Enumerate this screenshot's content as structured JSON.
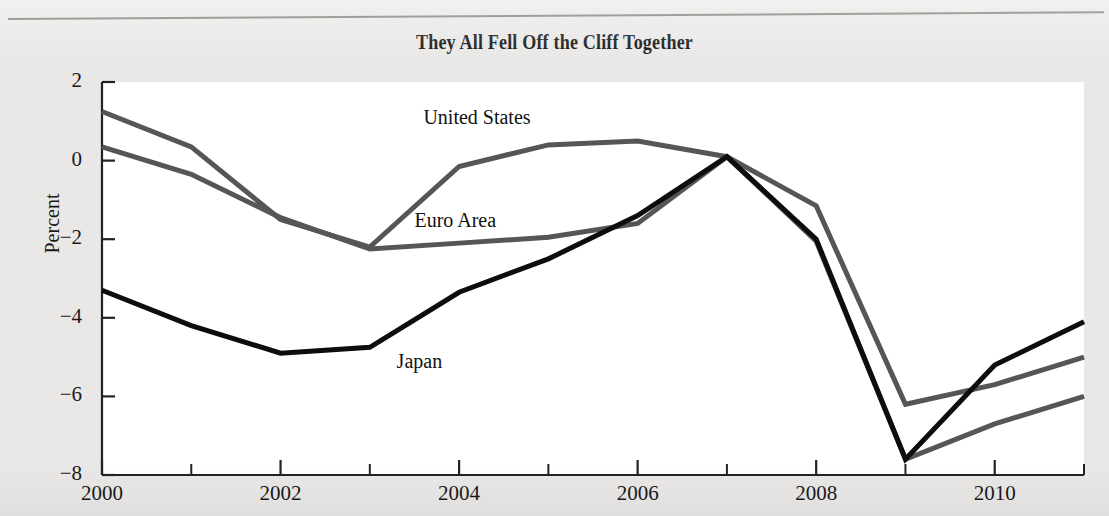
{
  "page": {
    "background_color": "#e9e8e6",
    "plot_background_color": "#ffffff"
  },
  "chart_data": {
    "type": "line",
    "title": "They All Fell Off the Cliff Together",
    "xlabel": "",
    "ylabel": "Percent",
    "x": [
      2000,
      2001,
      2002,
      2003,
      2004,
      2005,
      2006,
      2007,
      2008,
      2009,
      2010,
      2011
    ],
    "xlim": [
      2000,
      2011
    ],
    "ylim": [
      -8,
      2
    ],
    "yticks": [
      2,
      0,
      -2,
      -4,
      -6,
      -8
    ],
    "ytick_labels": [
      "2",
      "0",
      "−2",
      "−4",
      "−6",
      "−8"
    ],
    "xticks": [
      2000,
      2002,
      2004,
      2006,
      2008,
      2010
    ],
    "xtick_labels": [
      "2000",
      "2002",
      "2004",
      "2006",
      "2008",
      "2010"
    ],
    "xminor_ticks": [
      2001,
      2003,
      2005,
      2007,
      2009,
      2011
    ],
    "grid": false,
    "legend": "inline-annotations",
    "series": [
      {
        "name": "United States",
        "color": "#565656",
        "width": 5,
        "values": [
          1.25,
          0.35,
          -1.5,
          -2.2,
          -0.15,
          0.4,
          0.5,
          0.1,
          -1.15,
          -6.2,
          -5.7,
          -5.0
        ],
        "label_x": 2003.6,
        "label_y": 1.05
      },
      {
        "name": "Euro Area",
        "color": "#565656",
        "width": 5,
        "values": [
          0.35,
          -0.35,
          -1.45,
          -2.25,
          -2.1,
          -1.95,
          -1.6,
          0.1,
          -2.05,
          -7.6,
          -6.7,
          -6.0
        ],
        "label_x": 2003.5,
        "label_y": -1.55
      },
      {
        "name": "Japan",
        "color": "#0d0d0d",
        "width": 5,
        "values": [
          -3.3,
          -4.2,
          -4.9,
          -4.75,
          -3.35,
          -2.5,
          -1.4,
          0.1,
          -2.0,
          -7.6,
          -5.2,
          -4.1
        ],
        "label_x": 2003.3,
        "label_y": -5.15
      }
    ]
  }
}
